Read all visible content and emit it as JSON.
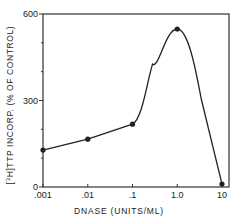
{
  "chart_data": {
    "type": "line",
    "title": "",
    "xlabel": "DNASE (UNITS/ML)",
    "ylabel": "[3H]TTP INCORP. (% OF CONTROL)",
    "ylabel_parts": {
      "open": "[",
      "sup": "3",
      "rest": "H]TTP  INCORP. (% OF CONTROL)"
    },
    "x_scale": "log",
    "x": [
      0.001,
      0.01,
      0.1,
      1.0,
      10
    ],
    "x_tick_labels": [
      ".001",
      ".01",
      ".1",
      "1.0",
      "10"
    ],
    "values": [
      128,
      166,
      218,
      548,
      10
    ],
    "y_ticks": [
      0,
      300,
      600
    ],
    "y_tick_labels": [
      "0",
      "300",
      "600"
    ],
    "y_minor_ticks": [
      100,
      200,
      400,
      500
    ],
    "ylim": [
      0,
      600
    ],
    "grid": false,
    "legend": null,
    "line_color": "#222222",
    "marker": "filled-circle",
    "curve_note": "smooth peak between 0.1 and 10 with maximum near 1.0"
  }
}
